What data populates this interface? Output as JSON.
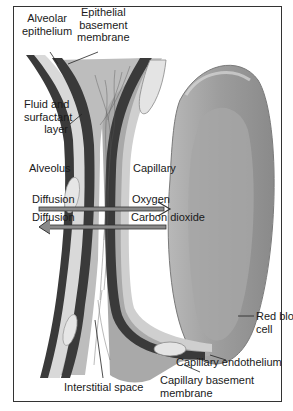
{
  "diagram": {
    "labels": {
      "alveolar_epithelium": [
        "Alveolar",
        "epithelium"
      ],
      "epithelial_basement_membrane": [
        "Epithelial",
        "basement",
        "membrane"
      ],
      "fluid_surfactant": [
        "Fluid and",
        "surfactant",
        "layer"
      ],
      "alveolus": "Alveolus",
      "capillary": "Capillary",
      "diffusion_1": "Diffusion",
      "diffusion_2": "Diffusion",
      "oxygen": "Oxygen",
      "carbon_dioxide": "Carbon dioxide",
      "red_blood_cell": [
        "Red blood",
        "cell"
      ],
      "capillary_endothelium": "Capillary endothelium",
      "capillary_basement_membrane": [
        "Capillary basement",
        "membrane"
      ],
      "interstitial_space": "Interstitial space"
    },
    "arrows": [
      {
        "name": "oxygen",
        "direction": "right",
        "from": "Alveolus",
        "to": "Capillary"
      },
      {
        "name": "carbon dioxide",
        "direction": "left",
        "from": "Capillary",
        "to": "Alveolus"
      }
    ],
    "colors": {
      "dark_layer": "#3a3a3a",
      "light_layer": "#d6d6d6",
      "mid_gray": "#a8a8a8",
      "rbc": "#9a9a9a",
      "frame": "#333333"
    }
  }
}
